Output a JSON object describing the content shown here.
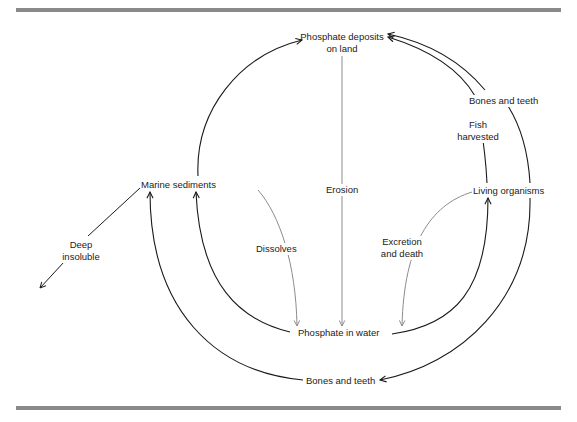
{
  "diagram": {
    "type": "cycle",
    "nodes": {
      "phosphate_land": "Phosphate deposits on land",
      "phosphate_land_line1": "Phosphate deposits",
      "phosphate_land_line2": "on land",
      "marine_sediments": "Marine sediments",
      "living_organisms": "Living organisms",
      "phosphate_water": "Phosphate in water"
    },
    "edge_labels": {
      "erosion": "Erosion",
      "dissolves": "Dissolves",
      "excretion_line1": "Excretion",
      "excretion_line2": "and death",
      "fish_line1": "Fish",
      "fish_line2": "harvested",
      "bones_top": "Bones and teeth",
      "bones_bottom": "Bones and teeth",
      "deep_line1": "Deep",
      "deep_line2": "insoluble"
    },
    "edges": [
      {
        "from": "Phosphate deposits on land",
        "to": "Phosphate in water",
        "label": "Erosion"
      },
      {
        "from": "Marine sediments",
        "to": "Phosphate in water",
        "label": "Dissolves"
      },
      {
        "from": "Living organisms",
        "to": "Phosphate in water",
        "label": "Excretion and death"
      },
      {
        "from": "Phosphate in water",
        "to": "Living organisms",
        "label": ""
      },
      {
        "from": "Phosphate in water",
        "to": "Marine sediments",
        "label": ""
      },
      {
        "from": "Marine sediments",
        "to": "Phosphate deposits on land",
        "label": ""
      },
      {
        "from": "Living organisms",
        "to": "Phosphate deposits on land",
        "label": "Fish harvested"
      },
      {
        "from": "Living organisms",
        "to": "Phosphate deposits on land",
        "label": "Bones and teeth"
      },
      {
        "from": "Living organisms",
        "to": "Bones and teeth (bottom)",
        "label": ""
      },
      {
        "from": "Bones and teeth (bottom)",
        "to": "Marine sediments",
        "label": ""
      },
      {
        "from": "Marine sediments",
        "to": "Deep insoluble",
        "label": ""
      }
    ],
    "colors": {
      "line_dark": "#1a1a1a",
      "line_light": "#8c8c8c",
      "rule": "#8a8a8a"
    }
  }
}
